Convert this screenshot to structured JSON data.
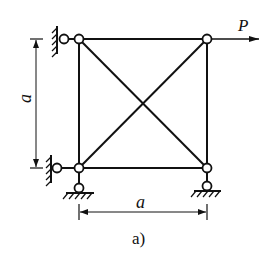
{
  "diagram": {
    "type": "truss",
    "caption": "a)",
    "load_label": "P",
    "width_label": "a",
    "height_label": "a",
    "colors": {
      "line": "#111111",
      "background": "#ffffff"
    },
    "nodes": [
      {
        "id": "top-left",
        "x": 79,
        "y": 39
      },
      {
        "id": "top-right",
        "x": 207,
        "y": 39
      },
      {
        "id": "bottom-left",
        "x": 79,
        "y": 168
      },
      {
        "id": "bottom-right",
        "x": 207,
        "y": 168
      }
    ],
    "members": [
      [
        "top-left",
        "top-right"
      ],
      [
        "bottom-left",
        "bottom-right"
      ],
      [
        "top-left",
        "bottom-left"
      ],
      [
        "top-right",
        "bottom-right"
      ],
      [
        "top-left",
        "bottom-right"
      ],
      [
        "top-right",
        "bottom-left"
      ]
    ],
    "supports": [
      {
        "at": "top-left",
        "type": "wall-link-left"
      },
      {
        "at": "bottom-left",
        "type": "wall-link-left"
      },
      {
        "at": "bottom-left",
        "type": "ground-pin"
      },
      {
        "at": "bottom-right",
        "type": "ground-pin"
      }
    ],
    "load": {
      "at": "top-right",
      "direction": "right"
    }
  }
}
